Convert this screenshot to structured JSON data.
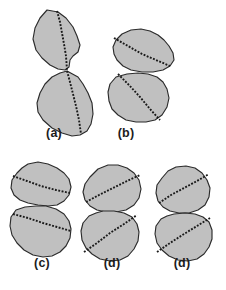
{
  "figure": {
    "background_color": "#ffffff",
    "shape_fill_color": "#c0c0c0",
    "shape_outline_color": "#2b2b2b",
    "fracture_line_color": "#1a1a1a",
    "label_color": "#1c1c1c",
    "panel_count": 5,
    "rows": 2
  },
  "panels": [
    {
      "id": "panel-a",
      "label": "(a)",
      "row": 1,
      "column": 1,
      "fragment_count": 2,
      "fracture_orientation": "vertical",
      "contact": "point-contact",
      "fragments": [
        {
          "name": "upper-fragment",
          "outline": "47,10 40,18 35,28 33,39 36,50 42,58 50,65 58,69 65,70 69,67 70,60 73,56 78,52 80,45 77,36 73,27 66,18 58,12",
          "fracture_start": "57,11",
          "fracture_end": "67,70"
        },
        {
          "name": "lower-fragment",
          "outline": "67,71 60,73 52,77 45,84 40,93 37,103 38,112 43,120 52,128 62,133 72,136 80,135 87,131 91,124 93,114 92,103 88,93 83,84 78,77",
          "fracture_start": "67,71",
          "fracture_end": "81,134"
        }
      ]
    },
    {
      "id": "panel-b",
      "label": "(b)",
      "row": 1,
      "column": 2,
      "fragment_count": 2,
      "fracture_orientation": "diagonal-down-right",
      "contact": "edge-contact",
      "fragments": [
        {
          "name": "upper-fragment",
          "outline": "122,34 116,40 113,47 114,54 117,60 123,66 131,70 142,72 153,72 163,70 170,66 174,60 173,53 169,46 164,40 158,35 150,31 141,29 131,30",
          "fracture_start": "114,38",
          "fracture_end": "170,66"
        },
        {
          "name": "lower-fragment",
          "outline": "116,77 110,84 108,92 109,101 112,109 118,115 126,120 136,122 146,122 155,120 162,115 167,107 169,98 167,89 163,82 157,77 148,74 138,73 127,74",
          "fracture_start": "118,74",
          "fracture_end": "160,120"
        }
      ]
    },
    {
      "id": "panel-c",
      "label": "(c)",
      "row": 2,
      "column": 1,
      "fragment_count": 2,
      "fracture_orientation": "diagonal-down-right",
      "contact": "edge-contact",
      "fragments": [
        {
          "name": "upper-fragment",
          "outline": "17,173 12,180 11,188 14,195 20,200 28,203 38,205 48,206 57,205 64,201 69,195 71,187 69,179 64,173 57,168 48,164 38,162 28,164 22,168",
          "fracture_start": "13,176",
          "fracture_end": "70,193"
        },
        {
          "name": "lower-fragment",
          "outline": "16,210 11,217 10,226 12,235 17,243 24,250 33,255 43,257 52,256 60,252 66,246 70,238 71,229 69,221 64,214 56,209 46,206 36,206 25,207",
          "fracture_start": "13,214",
          "fracture_end": "71,231"
        }
      ]
    },
    {
      "id": "panel-d1",
      "label": "(d)",
      "row": 2,
      "column": 2,
      "fragment_count": 2,
      "fracture_orientation": "diagonal-up-right",
      "contact": "edge-contact",
      "fragments": [
        {
          "name": "upper-fragment",
          "outline": "90,177 85,184 83,192 85,200 90,206 97,210 106,212 116,212 126,210 134,205 139,198 141,189 139,180 134,173 127,168 118,165 108,165 98,169",
          "fracture_start": "86,202",
          "fracture_end": "140,175"
        },
        {
          "name": "lower-fragment",
          "outline": "89,216 83,223 81,231 82,240 86,248 92,254 100,259 110,261 120,260 128,256 134,249 138,241 139,232 137,224 132,217 124,213 114,211 103,211 96,213",
          "fracture_start": "84,252",
          "fracture_end": "137,215"
        }
      ]
    },
    {
      "id": "panel-d2",
      "label": "(d)",
      "row": 2,
      "column": 3,
      "fragment_count": 2,
      "fracture_orientation": "diagonal-up-right",
      "contact": "edge-contact",
      "fragments": [
        {
          "name": "upper-fragment",
          "outline": "162,178 157,185 156,193 158,201 163,207 170,211 179,213 189,213 198,210 205,205 209,197 210,188 207,180 202,173 195,168 186,166 176,167 168,171",
          "fracture_start": "159,203",
          "fracture_end": "209,174"
        },
        {
          "name": "lower-fragment",
          "outline": "161,219 156,226 155,234 157,243 162,250 169,256 178,260 188,261 197,259 204,254 209,247 212,239 212,230 209,222 203,217 195,214 185,213 174,214 167,216",
          "fracture_start": "157,252",
          "fracture_end": "210,218"
        }
      ]
    }
  ],
  "labels": [
    {
      "text": "(a)",
      "x": 54,
      "y": 134
    },
    {
      "text": "(b)",
      "x": 126,
      "y": 134
    },
    {
      "text": "(c)",
      "x": 27,
      "y": 262
    },
    {
      "text": "(d)",
      "x": 97,
      "y": 262
    },
    {
      "text": "(d)",
      "x": 168,
      "y": 262
    }
  ]
}
